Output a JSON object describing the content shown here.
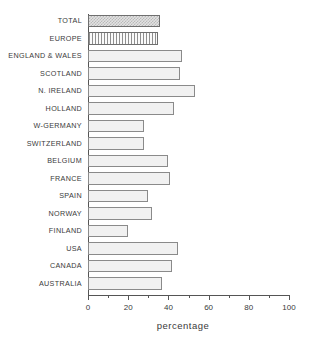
{
  "chart_data": {
    "type": "bar",
    "orientation": "horizontal",
    "title": "",
    "subtitle": "",
    "xlabel": "percentage",
    "ylabel": "",
    "xlim": [
      0,
      100
    ],
    "xticks": [
      0,
      20,
      40,
      60,
      80,
      100
    ],
    "xtick_labels": [
      "0",
      "20",
      "40",
      "60",
      "80",
      "100"
    ],
    "minor_xticks": [
      10,
      30,
      50,
      70,
      90
    ],
    "grid": false,
    "legend": "none",
    "categories": [
      "TOTAL",
      "EUROPE",
      "ENGLAND & WALES",
      "SCOTLAND",
      "N. IRELAND",
      "HOLLAND",
      "W-GERMANY",
      "SWITZERLAND",
      "BELGIUM",
      "FRANCE",
      "SPAIN",
      "NORWAY",
      "FINLAND",
      "USA",
      "CANADA",
      "AUSTRALIA"
    ],
    "values": [
      36,
      35,
      47,
      46,
      53,
      43,
      28,
      28,
      40,
      41,
      30,
      32,
      20,
      45,
      42,
      37
    ],
    "bar_styles": [
      "checker",
      "vstripe",
      "stipple",
      "stipple",
      "stipple",
      "stipple",
      "stipple",
      "stipple",
      "stipple",
      "stipple",
      "stipple",
      "stipple",
      "stipple",
      "stipple",
      "stipple",
      "stipple"
    ]
  },
  "colors": {
    "background": "#ffffff",
    "axis": "#555555",
    "text": "#3a3a3a",
    "bar_fill": "#f1f1f1",
    "bar_edge": "#8a8a8a"
  }
}
